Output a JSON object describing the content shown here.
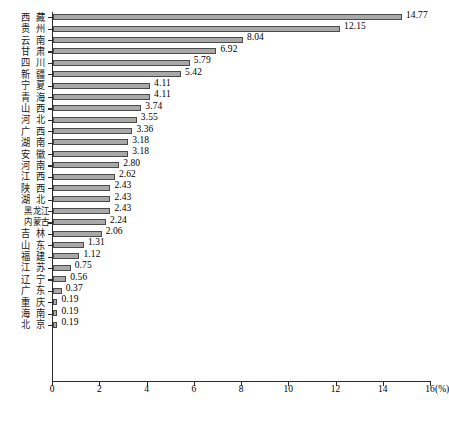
{
  "chart_data": {
    "type": "bar",
    "orientation": "horizontal",
    "title": "",
    "xlabel": "(%)",
    "ylabel": "",
    "xlim": [
      0,
      16
    ],
    "xticks": [
      0,
      2,
      4,
      6,
      8,
      10,
      12,
      14,
      16
    ],
    "xtick_labels": [
      "0",
      "2",
      "4",
      "6",
      "8",
      "10",
      "12",
      "14",
      "16"
    ],
    "x_unit_label": "16(%)",
    "unit_suffix": "(%)",
    "grid": false,
    "legend": false,
    "bar_color": "#a9a9a9",
    "bar_edge_color": "#4a4a4a",
    "axis_color": "#2b2b2b",
    "categories": [
      "西藏",
      "贵州",
      "云南",
      "甘肃",
      "四川",
      "新疆",
      "宁夏",
      "青海",
      "山西",
      "河北",
      "广西",
      "湖南",
      "安徽",
      "河南",
      "江西",
      "陕西",
      "湖北",
      "黑龙江",
      "内蒙古",
      "吉林",
      "山东",
      "福建",
      "江苏",
      "辽宁",
      "广东",
      "重庆",
      "海南",
      "北京"
    ],
    "values": [
      14.77,
      12.15,
      8.04,
      6.92,
      5.79,
      5.42,
      4.11,
      4.11,
      3.74,
      3.55,
      3.36,
      3.18,
      3.18,
      2.8,
      2.62,
      2.43,
      2.43,
      2.43,
      2.24,
      2.06,
      1.31,
      1.12,
      0.75,
      0.56,
      0.37,
      0.19,
      0.19,
      0.19
    ],
    "value_labels": [
      "14.77",
      "12.15",
      "8.04",
      "6.92",
      "5.79",
      "5.42",
      "4.11",
      "4.11",
      "3.74",
      "3.55",
      "3.36",
      "3.18",
      "3.18",
      "2.80",
      "2.62",
      "2.43",
      "2.43",
      "2.43",
      "2.24",
      "2.06",
      "1.31",
      "1.12",
      "0.75",
      "0.56",
      "0.37",
      "0.19",
      "0.19",
      "0.19"
    ]
  },
  "caption": ""
}
